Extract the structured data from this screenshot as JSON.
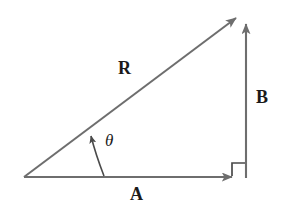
{
  "figure": {
    "name": "vector-addition-right-triangle",
    "background_color": "#ffffff",
    "stroke_color": "#6e6e6e",
    "label_color": "#1a1a1a",
    "width": 287,
    "height": 221
  },
  "labels": {
    "resultant": "R",
    "vertical_component": "B",
    "horizontal_component": "A",
    "angle": "θ"
  },
  "geometry": {
    "origin": {
      "x": 24,
      "y": 177
    },
    "corner": {
      "x": 246,
      "y": 177
    },
    "apex": {
      "x": 246,
      "y": 16
    },
    "resultant_arrow": {
      "x1": 24,
      "y1": 177,
      "x2": 241,
      "y2": 14
    },
    "horizontal_arrow": {
      "x1": 24,
      "y1": 177,
      "x2": 234,
      "y2": 177
    },
    "vertical_arrow": {
      "x1": 246,
      "y1": 178,
      "x2": 246,
      "y2": 15
    },
    "right_angle_marker": {
      "x": 232,
      "y": 162,
      "size": 14
    },
    "angle_arc": {
      "start_x": 104,
      "start_y": 176,
      "end_x": 89,
      "end_y": 130
    }
  }
}
